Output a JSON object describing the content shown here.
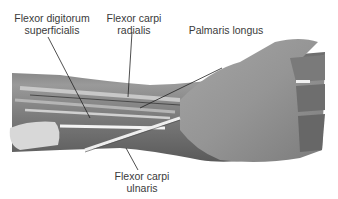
{
  "figure": {
    "labels": [
      {
        "id": "fds",
        "line1": "Flexor digitorum",
        "line2": "superficialis"
      },
      {
        "id": "fcr",
        "line1": "Flexor carpi",
        "line2": "radialis"
      },
      {
        "id": "pl",
        "line1": "Palmaris longus",
        "line2": ""
      },
      {
        "id": "fcu",
        "line1": "Flexor carpi",
        "line2": "ulnaris"
      }
    ]
  }
}
